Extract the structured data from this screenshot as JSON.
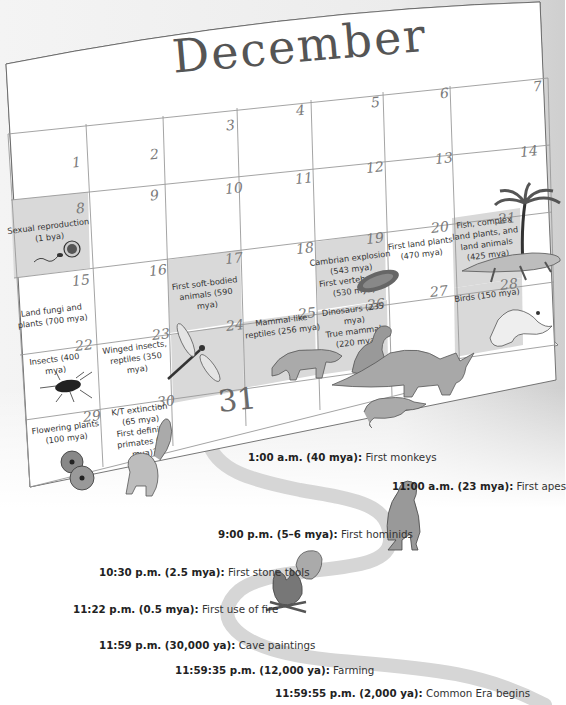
{
  "calendar": {
    "month": "December",
    "days": [
      {
        "day": "1",
        "event": ""
      },
      {
        "day": "2",
        "event": ""
      },
      {
        "day": "3",
        "event": ""
      },
      {
        "day": "4",
        "event": ""
      },
      {
        "day": "5",
        "event": ""
      },
      {
        "day": "6",
        "event": ""
      },
      {
        "day": "7",
        "event": ""
      },
      {
        "day": "8",
        "event": "Sexual reproduction\n(1 bya)"
      },
      {
        "day": "9",
        "event": ""
      },
      {
        "day": "10",
        "event": ""
      },
      {
        "day": "11",
        "event": ""
      },
      {
        "day": "12",
        "event": ""
      },
      {
        "day": "13",
        "event": ""
      },
      {
        "day": "14",
        "event": ""
      },
      {
        "day": "15",
        "event": "Land fungi and\nplants (700 mya)"
      },
      {
        "day": "16",
        "event": ""
      },
      {
        "day": "17",
        "event": "First soft-bodied\nanimals (590 mya)"
      },
      {
        "day": "18",
        "event": ""
      },
      {
        "day": "19",
        "event": "Cambrian explosion\n(543 mya)\nFirst vertebrates\n(530 mya)"
      },
      {
        "day": "20",
        "event": "First land plants\n(470 mya)"
      },
      {
        "day": "21",
        "event": "Fish, complex\nland plants, and\nland animals\n(425 mya)"
      },
      {
        "day": "22",
        "event": "Insects (400 mya)"
      },
      {
        "day": "23",
        "event": "Winged insects,\nreptiles (350 mya)"
      },
      {
        "day": "24",
        "event": ""
      },
      {
        "day": "25",
        "event": "Mammal-like\nreptiles (256 mya)"
      },
      {
        "day": "26",
        "event": "Dinosaurs (235 mya)\nTrue mammals\n(220 mya)"
      },
      {
        "day": "27",
        "event": ""
      },
      {
        "day": "28",
        "event": "Birds (150 mya)"
      },
      {
        "day": "29",
        "event": "Flowering plants\n(100 mya)"
      },
      {
        "day": "30",
        "event": "K/T extinction\n(65 mya)\nFirst definite\nprimates (55 mya)?"
      },
      {
        "day": "31",
        "event": ""
      }
    ],
    "highlight_color": "#d9d9d9",
    "grid_line_color": "#9a9a9a"
  },
  "timeline": [
    {
      "time": "1:00 a.m. (40 mya):",
      "event": "First monkeys"
    },
    {
      "time": "11:00 a.m. (23 mya):",
      "event": "First apes"
    },
    {
      "time": "9:00 p.m. (5–6 mya):",
      "event": "First hominids"
    },
    {
      "time": "10:30 p.m. (2.5 mya):",
      "event": "First stone tools"
    },
    {
      "time": "11:22 p.m. (0.5 mya):",
      "event": "First use of fire"
    },
    {
      "time": "11:59 p.m. (30,000 ya):",
      "event": "Cave paintings"
    },
    {
      "time": "11:59:35 p.m. (12,000 ya):",
      "event": "Farming"
    },
    {
      "time": "11:59:55 p.m. (2,000 ya):",
      "event": "Common Era begins"
    }
  ],
  "illustrations": [
    "sperm-egg",
    "trilobite",
    "palm-tree",
    "amphibian",
    "bird",
    "cockroach",
    "dragonfly",
    "mammal-like-reptile",
    "t-rex",
    "triceratops",
    "shrew",
    "flowers",
    "primate",
    "ape",
    "stone-tool",
    "campfire"
  ]
}
